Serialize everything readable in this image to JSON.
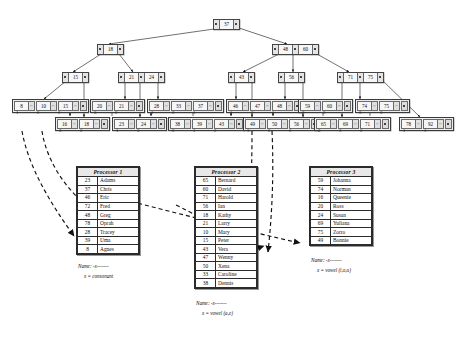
{
  "diagram": {
    "root": {
      "keys": [
        "37"
      ]
    },
    "level2": [
      {
        "keys": [
          "18"
        ]
      },
      {
        "keys": [
          "48",
          "60"
        ]
      }
    ],
    "level3": [
      {
        "keys": [
          "15"
        ]
      },
      {
        "keys": [
          "21",
          "24"
        ]
      },
      {
        "keys": [
          "43"
        ]
      },
      {
        "keys": [
          "56"
        ]
      },
      {
        "keys": [
          "71",
          "75"
        ]
      }
    ],
    "leaf_rows": {
      "upper": [
        {
          "values": [
            "8",
            "10",
            "15"
          ],
          "procs": [
            "1",
            "2",
            "2"
          ]
        },
        {
          "values": [
            "20",
            "21"
          ],
          "procs": [
            "3",
            "2"
          ]
        },
        {
          "values": [
            "28",
            "33",
            "37"
          ],
          "procs": [
            "1",
            "2",
            "1"
          ]
        },
        {
          "values": [
            "46",
            "47",
            "48"
          ],
          "procs": [
            "1",
            "2",
            "1"
          ]
        },
        {
          "values": [
            "59",
            "60"
          ],
          "procs": [
            "3",
            "2"
          ]
        },
        {
          "values": [
            "74",
            "75"
          ],
          "procs": [
            "3",
            "3"
          ]
        }
      ],
      "lower": [
        {
          "values": [
            "16",
            "18"
          ],
          "procs": [
            "3",
            "2"
          ]
        },
        {
          "values": [
            "23",
            "24"
          ],
          "procs": [
            "1",
            "3"
          ]
        },
        {
          "values": [
            "38",
            "39",
            "43"
          ],
          "procs": [
            "2",
            "1",
            "2"
          ]
        },
        {
          "values": [
            "49",
            "50",
            "56"
          ],
          "procs": [
            "3",
            "2",
            "2"
          ]
        },
        {
          "values": [
            "65",
            "69",
            "71"
          ],
          "procs": [
            "2",
            "3",
            "2"
          ]
        },
        {
          "values": [
            "78",
            "92"
          ],
          "procs": [
            "1",
            "1"
          ]
        }
      ]
    },
    "processors": [
      {
        "title": "Processor 1",
        "rows": [
          {
            "key": "23",
            "name": "Adams"
          },
          {
            "key": "37",
            "name": "Chris"
          },
          {
            "key": "46",
            "name": "Eric"
          },
          {
            "key": "72",
            "name": "Fred"
          },
          {
            "key": "48",
            "name": "Greg"
          },
          {
            "key": "78",
            "name": "Oprah"
          },
          {
            "key": "28",
            "name": "Tracey"
          },
          {
            "key": "39",
            "name": "Uma"
          },
          {
            "key": "8",
            "name": "Agnes"
          }
        ],
        "caption_line1": "Name: -x-------",
        "caption_line2": "x = consonant"
      },
      {
        "title": "Processor 2",
        "rows": [
          {
            "key": "65",
            "name": "Bernard"
          },
          {
            "key": "60",
            "name": "David"
          },
          {
            "key": "71",
            "name": "Harold"
          },
          {
            "key": "56",
            "name": "Ian"
          },
          {
            "key": "18",
            "name": "Kathy"
          },
          {
            "key": "21",
            "name": "Larry"
          },
          {
            "key": "10",
            "name": "Mary"
          },
          {
            "key": "15",
            "name": "Peter"
          },
          {
            "key": "43",
            "name": "Vera"
          },
          {
            "key": "47",
            "name": "Wenny"
          },
          {
            "key": "50",
            "name": "Xena"
          },
          {
            "key": "33",
            "name": "Caroline"
          },
          {
            "key": "38",
            "name": "Dennis"
          }
        ],
        "caption_line1": "Name: -x-------",
        "caption_line2": "x = vowel (a,e)"
      },
      {
        "title": "Processor 3",
        "rows": [
          {
            "key": "59",
            "name": "Johanna"
          },
          {
            "key": "74",
            "name": "Norman"
          },
          {
            "key": "16",
            "name": "Queenie"
          },
          {
            "key": "20",
            "name": "Ross"
          },
          {
            "key": "24",
            "name": "Susan"
          },
          {
            "key": "69",
            "name": "Yuliana"
          },
          {
            "key": "75",
            "name": "Zorro"
          },
          {
            "key": "49",
            "name": "Bonnie"
          }
        ],
        "caption_line1": "Name: -x-------",
        "caption_line2": "x = vowel (i,o,u)"
      }
    ]
  }
}
